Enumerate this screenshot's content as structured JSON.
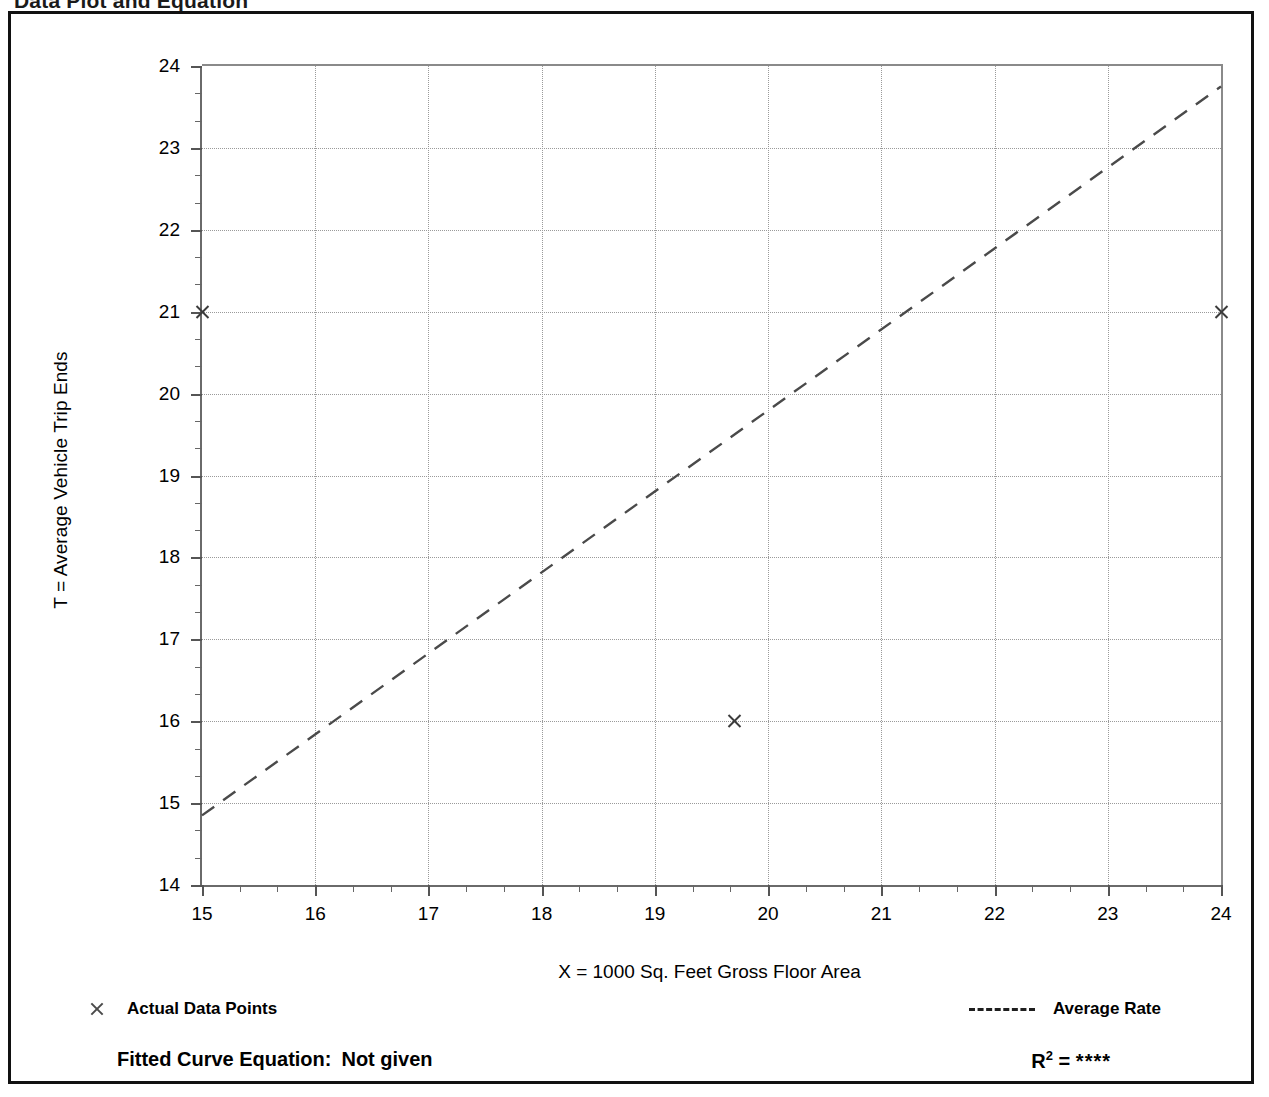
{
  "page": {
    "heading": "Data Plot and Equation",
    "heading_right": ""
  },
  "chart_data": {
    "type": "scatter",
    "title": "",
    "xlabel": "X = 1000 Sq. Feet Gross Floor Area",
    "ylabel": "T = Average Vehicle Trip Ends",
    "xlim": [
      15,
      24
    ],
    "ylim": [
      14,
      24
    ],
    "xticks": [
      15,
      16,
      17,
      18,
      19,
      20,
      21,
      22,
      23,
      24
    ],
    "yticks": [
      14,
      15,
      16,
      17,
      18,
      19,
      20,
      21,
      22,
      23,
      24
    ],
    "xtick_labels": [
      "15",
      "16",
      "17",
      "18",
      "19",
      "20",
      "21",
      "22",
      "23",
      "24"
    ],
    "ytick_labels": [
      "14",
      "15",
      "16",
      "17",
      "18",
      "19",
      "20",
      "21",
      "22",
      "23",
      "24"
    ],
    "minor_ticks_per_interval": 2,
    "grid": true,
    "legend_position": "below-axes",
    "series": [
      {
        "name": "Actual Data Points",
        "marker": "x",
        "type": "scatter",
        "points": [
          {
            "x": 15.0,
            "y": 21.0
          },
          {
            "x": 19.7,
            "y": 16.0
          },
          {
            "x": 24.0,
            "y": 21.0
          }
        ]
      },
      {
        "name": "Average Rate",
        "type": "line",
        "style": "dashed",
        "x": [
          15,
          24
        ],
        "y": [
          14.85,
          23.75
        ]
      }
    ]
  },
  "legend": {
    "points_label": "Actual Data Points",
    "rate_label": "Average Rate",
    "point_marker_icon": "x-marker-icon",
    "rate_line_icon": "dashed-line-icon"
  },
  "footer": {
    "equation_label": "Fitted Curve Equation:",
    "equation_value": "Not given",
    "r_label": "R",
    "r_exponent": "2",
    "r_equals": "=",
    "r_value": "****"
  }
}
